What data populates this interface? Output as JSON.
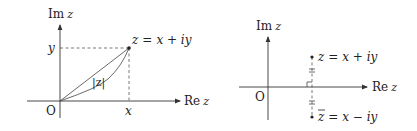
{
  "figure_left": {
    "title": "Complex number in the plane",
    "axis_imag_label": "Im z",
    "axis_real_label": "Re z",
    "origin_label": "O",
    "tick_y_label": "y",
    "tick_x_label": "x",
    "point_label": "z = x + iy",
    "modulus_label": "|z|",
    "imag_axis_prefix": "Im",
    "imag_axis_var": "z",
    "real_axis_prefix": "Re",
    "real_axis_var": "z",
    "point_var": "z",
    "point_eq": "=",
    "point_rhs": "x + iy"
  },
  "figure_right": {
    "title": "Complex conjugate reflection",
    "axis_imag_label": "Im z",
    "axis_real_label": "Re z",
    "origin_label": "O",
    "imag_axis_prefix": "Im",
    "imag_axis_var": "z",
    "real_axis_prefix": "Re",
    "real_axis_var": "z",
    "top_point_label": "z = x + iy",
    "top_point_var": "z",
    "top_point_rhs": "= x + iy",
    "bottom_point_label": "z̄ = x − iy",
    "bottom_point_var": "z",
    "bottom_point_rhs": "= x − iy"
  },
  "colors": {
    "line": "#333333",
    "text": "#222222",
    "background": "#ffffff"
  }
}
